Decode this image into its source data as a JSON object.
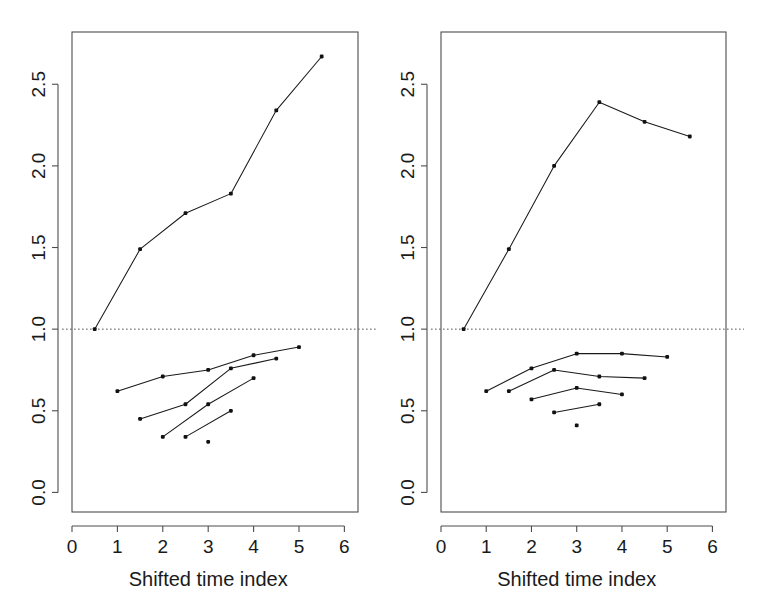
{
  "figure": {
    "background": "#ffffff",
    "panel_count": 2,
    "line_color": "#1a1a1a",
    "axis_color": "#4d4d4d",
    "reference_line_color": "#555555"
  },
  "chart_data": [
    {
      "panel": "left",
      "type": "line",
      "title": "",
      "xlabel": "Shifted time index",
      "ylabel": "",
      "xlim": [
        0,
        6.3
      ],
      "ylim": [
        -0.12,
        2.82
      ],
      "xticks": [
        0,
        1,
        2,
        3,
        4,
        5,
        6
      ],
      "xticklabels": [
        "0",
        "1",
        "2",
        "3",
        "4",
        "5",
        "6"
      ],
      "yticks": [
        0.0,
        0.5,
        1.0,
        1.5,
        2.0,
        2.5
      ],
      "yticklabels": [
        "0.0",
        "0.5",
        "1.0",
        "1.5",
        "2.0",
        "2.5"
      ],
      "grid": false,
      "legend": "none",
      "annotations": [
        {
          "kind": "hline",
          "y": 1.0,
          "style": "dotted",
          "label": "reference level 1.0"
        }
      ],
      "series": [
        {
          "name": "upper-trajectory",
          "x": [
            0.5,
            1.5,
            2.5,
            3.5,
            4.5,
            5.5
          ],
          "y": [
            1.0,
            1.49,
            1.71,
            1.83,
            2.34,
            2.67
          ]
        },
        {
          "name": "lower-trajectory-1",
          "x": [
            1.0,
            2.0,
            3.0,
            4.0,
            5.0
          ],
          "y": [
            0.62,
            0.71,
            0.75,
            0.84,
            0.89
          ]
        },
        {
          "name": "lower-trajectory-2",
          "x": [
            1.5,
            2.5,
            3.5,
            4.5
          ],
          "y": [
            0.45,
            0.54,
            0.76,
            0.82
          ]
        },
        {
          "name": "lower-trajectory-3",
          "x": [
            2.0,
            3.0,
            4.0
          ],
          "y": [
            0.34,
            0.54,
            0.7
          ]
        },
        {
          "name": "lower-trajectory-4",
          "x": [
            2.5,
            3.5
          ],
          "y": [
            0.34,
            0.5
          ]
        },
        {
          "name": "isolated-point",
          "x": [
            3.0
          ],
          "y": [
            0.31
          ]
        }
      ]
    },
    {
      "panel": "right",
      "type": "line",
      "title": "",
      "xlabel": "Shifted time index",
      "ylabel": "",
      "xlim": [
        0,
        6.3
      ],
      "ylim": [
        -0.12,
        2.82
      ],
      "xticks": [
        0,
        1,
        2,
        3,
        4,
        5,
        6
      ],
      "xticklabels": [
        "0",
        "1",
        "2",
        "3",
        "4",
        "5",
        "6"
      ],
      "yticks": [
        0.0,
        0.5,
        1.0,
        1.5,
        2.0,
        2.5
      ],
      "yticklabels": [
        "0.0",
        "0.5",
        "1.0",
        "1.5",
        "2.0",
        "2.5"
      ],
      "grid": false,
      "legend": "none",
      "annotations": [
        {
          "kind": "hline",
          "y": 1.0,
          "style": "dotted",
          "label": "reference level 1.0"
        }
      ],
      "series": [
        {
          "name": "upper-trajectory",
          "x": [
            0.5,
            1.5,
            2.5,
            3.5,
            4.5,
            5.5
          ],
          "y": [
            1.0,
            1.49,
            2.0,
            2.39,
            2.27,
            2.18
          ]
        },
        {
          "name": "lower-trajectory-1",
          "x": [
            1.0,
            2.0,
            3.0,
            4.0,
            5.0
          ],
          "y": [
            0.62,
            0.76,
            0.85,
            0.85,
            0.83
          ]
        },
        {
          "name": "lower-trajectory-2",
          "x": [
            1.5,
            2.5,
            3.5,
            4.5
          ],
          "y": [
            0.62,
            0.75,
            0.71,
            0.7
          ]
        },
        {
          "name": "lower-trajectory-3",
          "x": [
            2.0,
            3.0,
            4.0
          ],
          "y": [
            0.57,
            0.64,
            0.6
          ]
        },
        {
          "name": "lower-trajectory-4",
          "x": [
            2.5,
            3.5
          ],
          "y": [
            0.49,
            0.54
          ]
        },
        {
          "name": "isolated-point",
          "x": [
            3.0
          ],
          "y": [
            0.41
          ]
        }
      ]
    }
  ]
}
